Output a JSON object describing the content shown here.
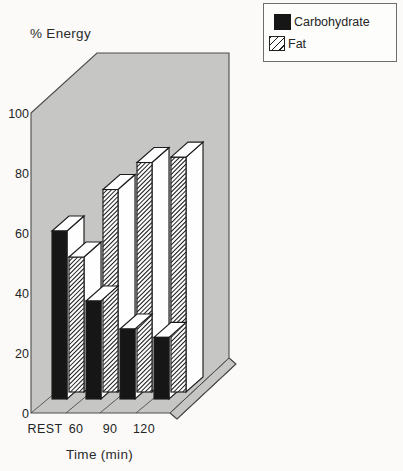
{
  "title": "% Energy",
  "x_axis_title": "Time (min)",
  "legend": {
    "position": "top-right",
    "items": [
      {
        "label": "Carbohydrate",
        "swatch": "solid-black-square-icon"
      },
      {
        "label": "Fat",
        "swatch": "diagonal-hatch-square-icon"
      }
    ]
  },
  "colors": {
    "backdrop_gray": "#c6c7c4",
    "edge_line": "#4c4c4c",
    "bar_black": "#161616",
    "bar_white": "#fefefe",
    "bar_outline": "#1c1c1c",
    "text": "#242424",
    "page_background": "#fbfaf8",
    "legend_background": "#fdfdfc"
  },
  "chart_data": {
    "type": "bar",
    "projection": "3d-oblique",
    "title": "% Energy",
    "xlabel": "Time (min)",
    "ylabel": "% Energy",
    "categories": [
      "REST",
      "60",
      "90",
      "120"
    ],
    "series": [
      {
        "name": "Carbohydrate",
        "style": "solid-black",
        "values": [
          60,
          35,
          25,
          22
        ]
      },
      {
        "name": "Fat",
        "style": "diagonal-hatch",
        "values": [
          50,
          75,
          85,
          87
        ]
      }
    ],
    "ylim": [
      0,
      100
    ],
    "yticks": [
      0,
      20,
      40,
      60,
      80,
      100
    ],
    "grid": false,
    "legend_position": "top-right",
    "backdrop": "gray 3d room (left wall, back wall, floor with category separators)"
  }
}
